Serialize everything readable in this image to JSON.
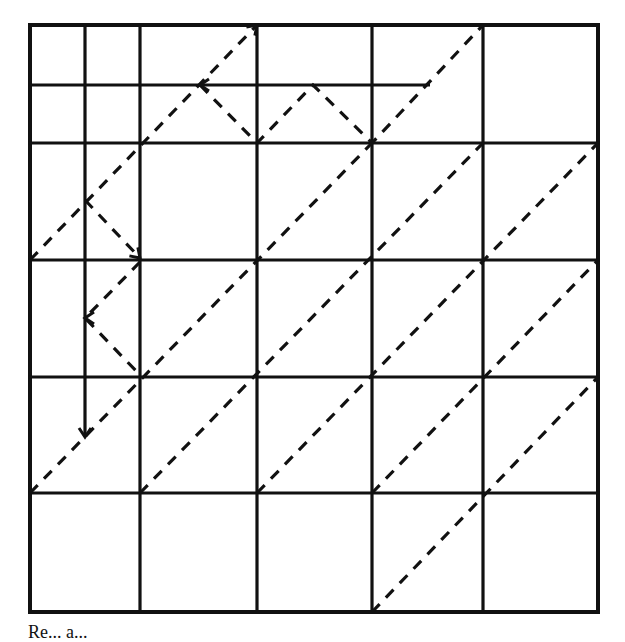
{
  "figure": {
    "type": "billiard-path grid diagram",
    "caption": "Re... a...",
    "colors": {
      "line": "#111111",
      "background": "#ffffff"
    },
    "grid": {
      "columns": 5,
      "rows": 5,
      "vertical_lines_x": [
        30,
        140,
        257,
        372,
        483,
        598
      ],
      "horizontal_lines_y": [
        25,
        143,
        260,
        377,
        493,
        612
      ],
      "extra_solid_lines": [
        {
          "name": "inner-vertical-wall",
          "x1": 85,
          "y1": 25,
          "x2": 85,
          "y2": 437
        },
        {
          "name": "inner-horizontal-wall",
          "x1": 30,
          "y1": 85,
          "x2": 430,
          "y2": 85
        }
      ]
    },
    "dashed_paths": [
      {
        "name": "path-a",
        "points": [
          [
            30,
            260
          ],
          [
            257,
            25
          ]
        ]
      },
      {
        "name": "path-b",
        "points": [
          [
            85,
            200
          ],
          [
            140,
            258
          ]
        ]
      },
      {
        "name": "path-c",
        "points": [
          [
            140,
            262
          ],
          [
            85,
            318
          ],
          [
            140,
            375
          ]
        ]
      },
      {
        "name": "path-d",
        "points": [
          [
            200,
            85
          ],
          [
            257,
            143
          ],
          [
            313,
            85
          ],
          [
            372,
            143
          ],
          [
            483,
            25
          ]
        ]
      },
      {
        "name": "path-e",
        "points": [
          [
            30,
            493
          ],
          [
            372,
            143
          ]
        ]
      },
      {
        "name": "path-f",
        "points": [
          [
            140,
            493
          ],
          [
            483,
            143
          ]
        ]
      },
      {
        "name": "path-g",
        "points": [
          [
            257,
            493
          ],
          [
            598,
            143
          ]
        ]
      },
      {
        "name": "path-h",
        "points": [
          [
            372,
            493
          ],
          [
            598,
            260
          ]
        ]
      },
      {
        "name": "path-i",
        "points": [
          [
            372,
            612
          ],
          [
            598,
            377
          ]
        ]
      }
    ],
    "arrowheads": [
      {
        "at": [
          257,
          25
        ],
        "dir": "up-right"
      },
      {
        "at": [
          140,
          258
        ],
        "dir": "down-right"
      },
      {
        "at": [
          85,
          318
        ],
        "dir": "left"
      },
      {
        "at": [
          200,
          85
        ],
        "dir": "left"
      },
      {
        "at": [
          85,
          437
        ],
        "dir": "down"
      }
    ]
  }
}
